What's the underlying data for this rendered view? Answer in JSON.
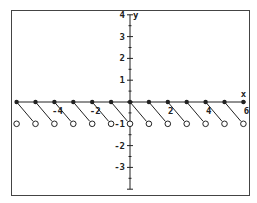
{
  "chart_data": {
    "type": "scatter",
    "title": "",
    "xlabel": "x",
    "ylabel": "y",
    "xlim": [
      -6.5,
      6.5
    ],
    "ylim": [
      -4,
      4
    ],
    "grid": false,
    "x_ticks": [
      -4,
      -2,
      2,
      4,
      6
    ],
    "y_ticks": [
      -3,
      -2,
      -1,
      1,
      2,
      3,
      4
    ],
    "x_tick_labels": [
      "-4",
      "-2",
      "2",
      "4",
      "6"
    ],
    "y_tick_labels": [
      "-3",
      "-2",
      "-1",
      "1",
      "2",
      "3",
      "4"
    ],
    "series": [
      {
        "name": "closed-points",
        "marker": "filled",
        "points": [
          [
            -6,
            0
          ],
          [
            -5,
            0
          ],
          [
            -4,
            0
          ],
          [
            -3,
            0
          ],
          [
            -2,
            0
          ],
          [
            -1,
            0
          ],
          [
            0,
            0
          ],
          [
            1,
            0
          ],
          [
            2,
            0
          ],
          [
            3,
            0
          ],
          [
            4,
            0
          ],
          [
            5,
            0
          ],
          [
            6,
            0
          ]
        ]
      },
      {
        "name": "open-points",
        "marker": "open",
        "points": [
          [
            -6,
            -1
          ],
          [
            -5,
            -1
          ],
          [
            -4,
            -1
          ],
          [
            -3,
            -1
          ],
          [
            -2,
            -1
          ],
          [
            -1,
            -1
          ],
          [
            0,
            -1
          ],
          [
            1,
            -1
          ],
          [
            2,
            -1
          ],
          [
            3,
            -1
          ],
          [
            4,
            -1
          ],
          [
            5,
            -1
          ],
          [
            6,
            -1
          ]
        ]
      },
      {
        "name": "segments",
        "type": "line",
        "segments": [
          [
            [
              -6,
              0
            ],
            [
              -5,
              -1
            ]
          ],
          [
            [
              -5,
              0
            ],
            [
              -4,
              -1
            ]
          ],
          [
            [
              -4,
              0
            ],
            [
              -3,
              -1
            ]
          ],
          [
            [
              -3,
              0
            ],
            [
              -2,
              -1
            ]
          ],
          [
            [
              -2,
              0
            ],
            [
              -1,
              -1
            ]
          ],
          [
            [
              -1,
              0
            ],
            [
              0,
              -1
            ]
          ],
          [
            [
              0,
              0
            ],
            [
              1,
              -1
            ]
          ],
          [
            [
              1,
              0
            ],
            [
              2,
              -1
            ]
          ],
          [
            [
              2,
              0
            ],
            [
              3,
              -1
            ]
          ],
          [
            [
              3,
              0
            ],
            [
              4,
              -1
            ]
          ],
          [
            [
              4,
              0
            ],
            [
              5,
              -1
            ]
          ],
          [
            [
              5,
              0
            ],
            [
              6,
              -1
            ]
          ]
        ]
      }
    ]
  },
  "colors": {
    "ink": "#222222",
    "frame": "#444444",
    "background": "#ffffff"
  }
}
